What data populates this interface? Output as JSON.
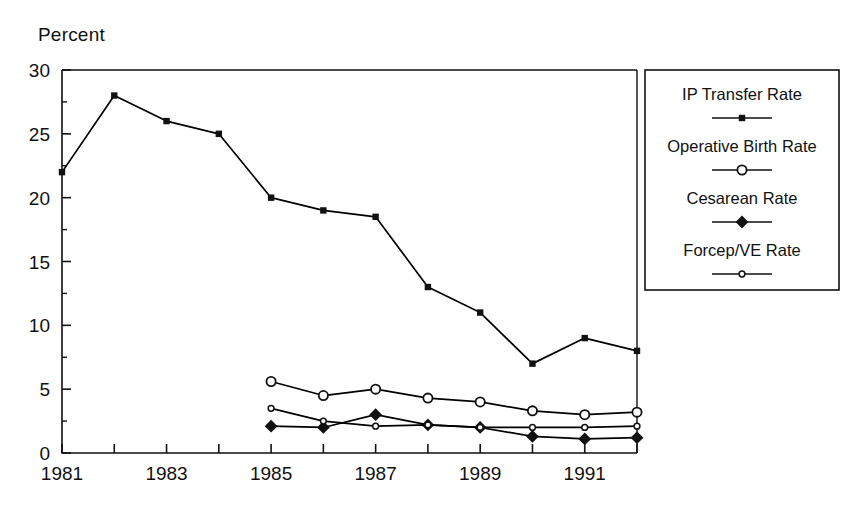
{
  "chart_data": {
    "type": "line",
    "title": "",
    "ylabel": "Percent",
    "xlabel": "",
    "ylim": [
      0,
      30
    ],
    "xlim": [
      1981,
      1992
    ],
    "ytick_values": [
      0,
      5,
      10,
      15,
      20,
      25,
      30
    ],
    "ytick_labels": [
      "0",
      "5",
      "10",
      "15",
      "20",
      "25",
      "30"
    ],
    "yminor_values": [
      2.5,
      7.5,
      12.5,
      17.5,
      22.5,
      27.5
    ],
    "x": [
      1981,
      1982,
      1983,
      1984,
      1985,
      1986,
      1987,
      1988,
      1989,
      1990,
      1991,
      1992
    ],
    "xtick_values": [
      1981,
      1982,
      1983,
      1984,
      1985,
      1986,
      1987,
      1988,
      1989,
      1990,
      1991,
      1992
    ],
    "xtick_labels": [
      "1981",
      "",
      "1983",
      "",
      "1985",
      "",
      "1987",
      "",
      "1989",
      "",
      "1991",
      ""
    ],
    "grid": false,
    "legend_position": "right-outside",
    "series": [
      {
        "name": "IP Transfer Rate",
        "marker": "filled-square",
        "color": "#000000",
        "x": [
          1981,
          1982,
          1983,
          1984,
          1985,
          1986,
          1987,
          1988,
          1989,
          1990,
          1991,
          1992
        ],
        "values": [
          22.0,
          28.0,
          26.0,
          25.0,
          20.0,
          19.0,
          18.5,
          13.0,
          11.0,
          7.0,
          9.0,
          8.0
        ]
      },
      {
        "name": "Operative Birth Rate",
        "marker": "open-circle",
        "color": "#000000",
        "x": [
          1985,
          1986,
          1987,
          1988,
          1989,
          1990,
          1991,
          1992
        ],
        "values": [
          5.6,
          4.5,
          5.0,
          4.3,
          4.0,
          3.3,
          3.0,
          3.2
        ]
      },
      {
        "name": "Cesarean Rate",
        "marker": "filled-diamond",
        "color": "#000000",
        "x": [
          1985,
          1986,
          1987,
          1988,
          1989,
          1990,
          1991,
          1992
        ],
        "values": [
          2.1,
          2.0,
          3.0,
          2.2,
          2.0,
          1.3,
          1.1,
          1.2
        ]
      },
      {
        "name": "Forcep/VE Rate",
        "marker": "small-open-circle",
        "color": "#000000",
        "x": [
          1985,
          1986,
          1987,
          1988,
          1989,
          1990,
          1991,
          1992
        ],
        "values": [
          3.5,
          2.5,
          2.1,
          2.2,
          2.0,
          2.0,
          2.0,
          2.1
        ]
      }
    ]
  },
  "legend": {
    "entries": [
      {
        "label": "IP Transfer Rate",
        "marker": "filled-square"
      },
      {
        "label": "Operative Birth Rate",
        "marker": "open-circle"
      },
      {
        "label": "Cesarean Rate",
        "marker": "filled-diamond"
      },
      {
        "label": "Forcep/VE Rate",
        "marker": "small-open-circle"
      }
    ]
  }
}
